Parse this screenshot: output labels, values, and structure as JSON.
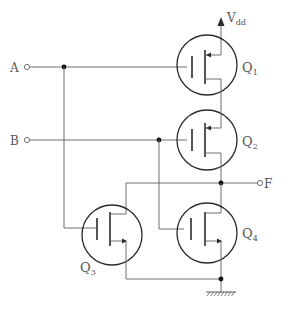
{
  "diagram": {
    "type": "CMOS NAND-style logic gate schematic",
    "supply": {
      "label": "V",
      "subscript": "dd"
    },
    "inputs": [
      {
        "id": "A",
        "label": "A"
      },
      {
        "id": "B",
        "label": "B"
      }
    ],
    "output": {
      "id": "F",
      "label": "F"
    },
    "transistors": [
      {
        "id": "Q1",
        "label": "Q",
        "subscript": "1",
        "type": "PMOS",
        "gate": "A"
      },
      {
        "id": "Q2",
        "label": "Q",
        "subscript": "2",
        "type": "PMOS",
        "gate": "B"
      },
      {
        "id": "Q3",
        "label": "Q",
        "subscript": "3",
        "type": "NMOS",
        "gate": "A"
      },
      {
        "id": "Q4",
        "label": "Q",
        "subscript": "4",
        "type": "NMOS",
        "gate": "B"
      }
    ],
    "ground": {
      "label": "ground"
    },
    "colors": {
      "wire": "#6e6e6e",
      "device": "#2b2b2b",
      "text": "#555555"
    }
  }
}
